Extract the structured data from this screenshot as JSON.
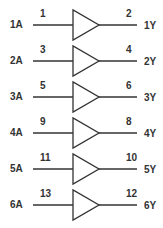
{
  "diagram": {
    "type": "hex buffer logic diagram",
    "line_color": "#333333",
    "gates": [
      {
        "input": "1A",
        "input_pin": "1",
        "output_pin": "2",
        "output": "1Y"
      },
      {
        "input": "2A",
        "input_pin": "3",
        "output_pin": "4",
        "output": "2Y"
      },
      {
        "input": "3A",
        "input_pin": "5",
        "output_pin": "6",
        "output": "3Y"
      },
      {
        "input": "4A",
        "input_pin": "9",
        "output_pin": "8",
        "output": "4Y"
      },
      {
        "input": "5A",
        "input_pin": "11",
        "output_pin": "10",
        "output": "5Y"
      },
      {
        "input": "6A",
        "input_pin": "13",
        "output_pin": "12",
        "output": "6Y"
      }
    ]
  }
}
